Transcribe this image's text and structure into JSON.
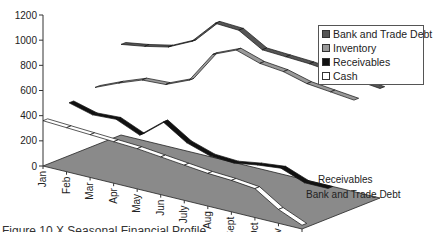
{
  "chart_data": {
    "type": "line",
    "subtype": "3d-line",
    "title": "",
    "xlabel": "",
    "ylabel": "",
    "ylim": [
      0,
      1200
    ],
    "yticks": [
      0,
      200,
      400,
      600,
      800,
      1000,
      1200
    ],
    "categories": [
      "Jan",
      "Feb",
      "Mar",
      "Apr",
      "May",
      "Jun",
      "July",
      "Aug",
      "Sept",
      "Oct",
      "Nov",
      "Dec"
    ],
    "depth_labels": [
      "Receivables",
      "Bank and Trade Debt"
    ],
    "grid": false,
    "legend_position": "right",
    "series": [
      {
        "name": "Bank and Trade Debt",
        "color": "#555555",
        "values": [
          720,
          750,
          790,
          880,
          1070,
          1060,
          950,
          940,
          930,
          910,
          890,
          870
        ]
      },
      {
        "name": "Inventory",
        "color": "#999999",
        "values": [
          460,
          540,
          610,
          620,
          700,
          950,
          1030,
          970,
          950,
          900,
          880,
          860
        ]
      },
      {
        "name": "Receivables",
        "color": "#111111",
        "values": [
          420,
          370,
          380,
          300,
          450,
          330,
          270,
          260,
          290,
          310,
          240,
          240
        ]
      },
      {
        "name": "Cash",
        "color": "#ffffff",
        "values": [
          360,
          350,
          340,
          330,
          320,
          300,
          280,
          260,
          250,
          230,
          110,
          30
        ]
      }
    ]
  },
  "legend": {
    "items": [
      {
        "label": "Bank and Trade Debt",
        "color": "#555555"
      },
      {
        "label": "Inventory",
        "color": "#999999"
      },
      {
        "label": "Receivables",
        "color": "#111111"
      },
      {
        "label": "Cash",
        "color": "#ffffff"
      }
    ]
  },
  "caption": "Figure 10.X  Seasonal Financial Profile"
}
